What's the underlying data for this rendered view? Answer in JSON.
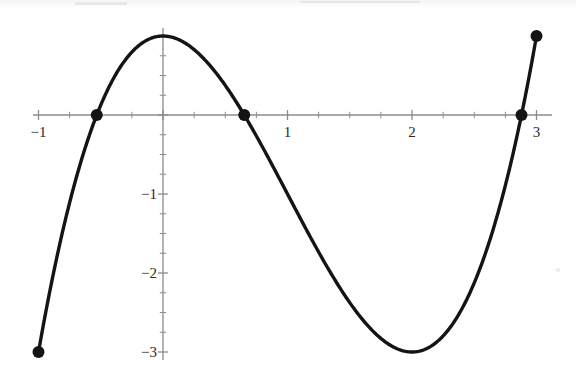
{
  "chart_data": {
    "type": "line",
    "title": "",
    "subtitle": "",
    "xlabel": "",
    "ylabel": "",
    "xlim": [
      -1.2,
      3.2
    ],
    "ylim": [
      -3.25,
      1.35
    ],
    "grid": false,
    "legend": null,
    "x_ticks": [
      {
        "value": -1,
        "label": "−1"
      },
      {
        "value": 0,
        "label": ""
      },
      {
        "value": 1,
        "label": "1"
      },
      {
        "value": 2,
        "label": "2"
      },
      {
        "value": 3,
        "label": "3"
      }
    ],
    "y_ticks": [
      {
        "value": -1,
        "label": "−1"
      },
      {
        "value": -2,
        "label": "−2"
      },
      {
        "value": -3,
        "label": "−3"
      }
    ],
    "x_minor_tick_step": 0.25,
    "y_minor_tick_step": 0.25,
    "series": [
      {
        "name": "cubic",
        "expression": "x^3 - 3x^2 + 1",
        "color": "#141414",
        "line_width": 3.4,
        "domain": [
          -1,
          3
        ],
        "x": [
          -1.0,
          -0.9,
          -0.8,
          -0.7,
          -0.6,
          -0.5,
          -0.4,
          -0.3,
          -0.2,
          -0.1,
          0.0,
          0.1,
          0.2,
          0.3,
          0.4,
          0.5,
          0.6,
          0.7,
          0.8,
          0.9,
          1.0,
          1.1,
          1.2,
          1.3,
          1.4,
          1.5,
          1.6,
          1.7,
          1.8,
          1.9,
          2.0,
          2.1,
          2.2,
          2.3,
          2.4,
          2.5,
          2.6,
          2.7,
          2.8,
          2.9,
          3.0
        ],
        "y": [
          -3.0,
          -2.159,
          -1.432,
          -0.813,
          -0.296,
          0.125,
          0.456,
          0.703,
          0.872,
          0.969,
          1.0,
          0.971,
          0.888,
          0.757,
          0.584,
          0.375,
          0.136,
          -0.127,
          -0.408,
          -0.701,
          -1.0,
          -1.299,
          -1.592,
          -1.873,
          -2.136,
          -2.375,
          -2.584,
          -2.757,
          -2.888,
          -2.971,
          -3.0,
          -2.969,
          -2.872,
          -2.703,
          -2.456,
          -2.125,
          -1.704,
          -1.187,
          -0.568,
          0.159,
          1.0
        ]
      }
    ],
    "markers": [
      {
        "name": "left-endpoint",
        "x": -1.0,
        "y": -3.0,
        "style": "filled-circle",
        "radius": 6
      },
      {
        "name": "root-left",
        "x": -0.5321,
        "y": 0.0,
        "style": "filled-circle",
        "radius": 6
      },
      {
        "name": "root-middle",
        "x": 0.6527,
        "y": 0.0,
        "style": "filled-circle",
        "radius": 6
      },
      {
        "name": "root-right",
        "x": 2.8794,
        "y": 0.0,
        "style": "filled-circle",
        "radius": 6
      },
      {
        "name": "right-endpoint",
        "x": 3.0,
        "y": 1.0,
        "style": "filled-circle",
        "radius": 6
      }
    ],
    "axis_color": "#8c8c8c",
    "curve_color": "#141414",
    "background_color": "#ffffff"
  }
}
